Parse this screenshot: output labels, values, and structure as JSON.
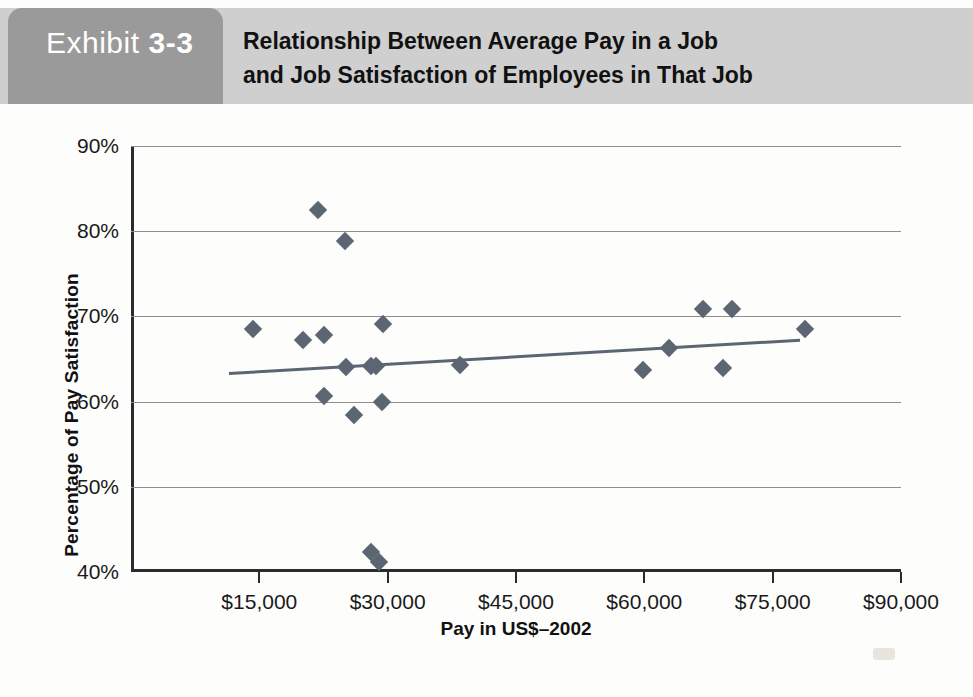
{
  "exhibit": {
    "word": "Exhibit",
    "number": "3-3"
  },
  "header": {
    "title_line1": "Relationship Between Average Pay in a Job",
    "title_line2": "and Job Satisfaction of Employees in That Job"
  },
  "colors": {
    "tab_bg": "#9a9a9a",
    "band_bg": "#cfcfcf",
    "marker": "#5c6673",
    "gridline": "#8e8e8e",
    "axis": "#2b2b2b"
  },
  "chart_data": {
    "type": "scatter",
    "title": "Relationship Between Average Pay in a Job and Job Satisfaction of Employees in That Job",
    "xlabel": "Pay in US$–2002",
    "ylabel": "Percentage of Pay Satisfaction",
    "xlim": [
      0,
      90000
    ],
    "ylim": [
      40,
      90
    ],
    "grid": true,
    "legend": null,
    "xticks": [
      15000,
      30000,
      45000,
      60000,
      75000,
      90000
    ],
    "xticklabels": [
      "$15,000",
      "$30,000",
      "$45,000",
      "$60,000",
      "$75,000",
      "$90,000"
    ],
    "yticks": [
      40,
      50,
      60,
      70,
      80,
      90
    ],
    "yticklabels": [
      "40%",
      "50%",
      "60%",
      "70%",
      "80%",
      "90%"
    ],
    "series": [
      {
        "name": "Jobs",
        "marker": "diamond",
        "color": "#5c6673",
        "points": [
          {
            "x": 14300,
            "y": 68.5
          },
          {
            "x": 20100,
            "y": 67.2
          },
          {
            "x": 21800,
            "y": 82.5
          },
          {
            "x": 22600,
            "y": 67.8
          },
          {
            "x": 22600,
            "y": 60.7
          },
          {
            "x": 25000,
            "y": 78.9
          },
          {
            "x": 25100,
            "y": 64.1
          },
          {
            "x": 26100,
            "y": 58.4
          },
          {
            "x": 28100,
            "y": 64.2
          },
          {
            "x": 28600,
            "y": 64.2
          },
          {
            "x": 28100,
            "y": 42.3
          },
          {
            "x": 29000,
            "y": 41.2
          },
          {
            "x": 29300,
            "y": 60.0
          },
          {
            "x": 29400,
            "y": 69.1
          },
          {
            "x": 38500,
            "y": 64.3
          },
          {
            "x": 59800,
            "y": 63.7
          },
          {
            "x": 62900,
            "y": 66.3
          },
          {
            "x": 66800,
            "y": 70.9
          },
          {
            "x": 70300,
            "y": 70.9
          },
          {
            "x": 69200,
            "y": 64.0
          },
          {
            "x": 78800,
            "y": 68.5
          }
        ]
      }
    ],
    "trendline": {
      "name": "Linear fit",
      "color": "#5c6673",
      "x_start": 11500,
      "y_start": 63.5,
      "x_end": 78200,
      "y_end": 67.4
    }
  }
}
